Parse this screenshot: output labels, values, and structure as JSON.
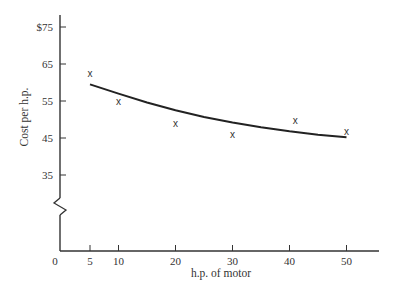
{
  "chart_data": {
    "type": "scatter",
    "title": "",
    "xlabel": "h.p. of motor",
    "ylabel": "Cost per h.p.",
    "x_ticks": [
      0,
      5,
      10,
      20,
      30,
      40,
      50
    ],
    "x_tick_labels": [
      "0",
      "5",
      "10",
      "20",
      "30",
      "40",
      "50"
    ],
    "y_ticks": [
      35,
      45,
      55,
      65,
      75
    ],
    "y_tick_labels": [
      "35",
      "45",
      "55",
      "65",
      "$75"
    ],
    "xlim": [
      0,
      56
    ],
    "ylim": [
      35,
      78
    ],
    "y_axis_break": true,
    "grid": false,
    "legend": null,
    "series": [
      {
        "name": "observed",
        "style": "markers",
        "marker": "x",
        "x": [
          5,
          10,
          20,
          30,
          41,
          50
        ],
        "y": [
          62.5,
          55,
          49,
          46,
          50,
          47
        ]
      },
      {
        "name": "fitted curve",
        "style": "line",
        "x": [
          5,
          10,
          15,
          20,
          25,
          30,
          35,
          40,
          45,
          50
        ],
        "y": [
          59.5,
          57,
          54.6,
          52.5,
          50.7,
          49.2,
          47.9,
          46.8,
          45.9,
          45.2
        ]
      }
    ]
  }
}
